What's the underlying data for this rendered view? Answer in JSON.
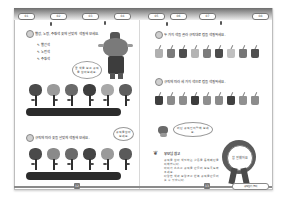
{
  "header": {
    "tabs": [
      "01",
      "02",
      "03",
      "04",
      "05",
      "06",
      "07",
      "08"
    ]
  },
  "left_page": {
    "question1": "빨강, 노랑, 주황색 꽃에 알맞게 색칠해 보세요.",
    "options": [
      "빨간색",
      "노란색",
      "주황색"
    ],
    "speech_bubble": "꽃 색을 보고 규칙을 찾아보세요.",
    "question2": "규칙에 따라 꽃을 알맞게 색칠해 보세요.",
    "small_bubble": "규칙을 찾아 보세요."
  },
  "right_page": {
    "question1": "두 가지 색을 골라 규칙대로 컵을 색칠하세요.",
    "question2": "규칙에 따라 세 가지 색으로 컵을 색칠하세요.",
    "speech_bubble": "어떤 규칙인지 말해 보세요.",
    "note_title": "부모님 참고",
    "note_lines": [
      "규칙을 찾아 색칠하는 활동을 통해 패턴을 이해합니다.",
      "아이가 스스로 규칙을 만들어 보도록 도와주세요.",
      "다양한 색과 모양으로 반복 규칙을 만들어 볼 수 있습니다."
    ],
    "badge_text": "참 잘했어요"
  },
  "footer": {
    "left_page_number": "12",
    "right_page_number": "13",
    "label": "규칙 찾기 놀이"
  },
  "colors": {
    "flowers_row1": [
      "#4a4a4a",
      "#9a9a9a",
      "#6a6a6a",
      "#3e3e3e",
      "#a8a8a8",
      "#5e5e5e"
    ],
    "flowers_row2": [
      "#4a4a4a",
      "#8a8a8a",
      "#6a6a6a",
      "#454545",
      "#9a9a9a",
      "#5a5a5a"
    ],
    "cups_row1": [
      "#b0b0b0",
      "#7a7a7a",
      "#4e4e4e",
      "#b4b4b4",
      "#7c7c7c",
      "#4c4c4c",
      "#c0c0c0",
      "#767676",
      "#505050"
    ],
    "cups_row2": [
      "#3e3e3e",
      "#8a8a8a",
      "#8c8c8c",
      "#3c3c3c",
      "#8e8e8e",
      "#8a8a8a",
      "#404040",
      "#909090",
      "#8c8c8c"
    ]
  }
}
